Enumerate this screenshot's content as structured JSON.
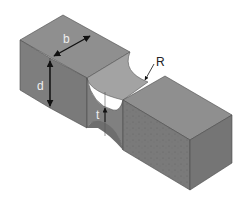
{
  "figure": {
    "labels": {
      "width": "b",
      "depth": "d",
      "radius": "R",
      "thickness": "t"
    },
    "colors": {
      "background": "#ffffff",
      "top_face": "#8e8e8e",
      "front_face": "#7d7d7d",
      "side_face": "#737373",
      "notch_face": "#9e9e9e",
      "edge": "#4a4a4a",
      "arrow": "#111111",
      "label_light": "#eeeeee",
      "label_dark": "#222222"
    }
  }
}
